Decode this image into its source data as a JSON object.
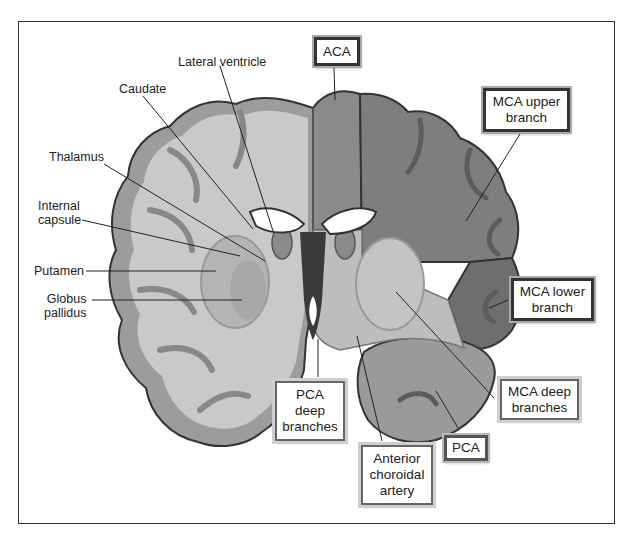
{
  "diagram": {
    "structure_labels": [
      {
        "id": "lateral-ventricle",
        "text": "Lateral ventricle"
      },
      {
        "id": "caudate",
        "text": "Caudate"
      },
      {
        "id": "thalamus",
        "text": "Thalamus"
      },
      {
        "id": "internal-capsule",
        "text": "Internal\ncapsule"
      },
      {
        "id": "putamen",
        "text": "Putamen"
      },
      {
        "id": "globus-pallidus",
        "text": "Globus\npallidus"
      }
    ],
    "territory_labels": [
      {
        "id": "aca",
        "text": "ACA"
      },
      {
        "id": "mca-upper",
        "text": "MCA upper\nbranch"
      },
      {
        "id": "mca-lower",
        "text": "MCA lower\nbranch"
      },
      {
        "id": "mca-deep",
        "text": "MCA deep\nbranches"
      },
      {
        "id": "pca",
        "text": "PCA"
      },
      {
        "id": "pca-deep",
        "text": "PCA\ndeep\nbranches"
      },
      {
        "id": "anterior-choroidal",
        "text": "Anterior\nchoroidal\nartery"
      }
    ],
    "colors": {
      "aca_territory": "#8a8a8a",
      "mca_upper_territory": "#7e7e7e",
      "mca_lower_territory": "#6e6e6e",
      "mca_deep_territory": "#bdbdbd",
      "pca_territory": "#9a9a9a",
      "left_hemisphere_white": "#c8c8c8",
      "left_hemisphere_gray": "#9c9c9c",
      "ventricle": "#ffffff",
      "outline": "#333333"
    }
  }
}
